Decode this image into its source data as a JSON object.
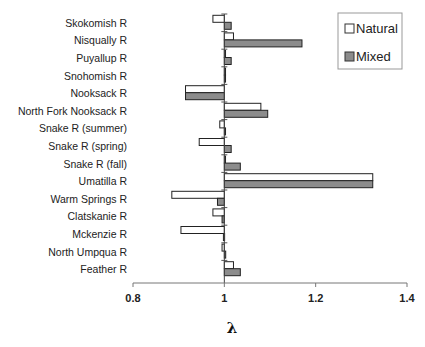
{
  "chart_data": {
    "type": "bar",
    "orientation": "horizontal",
    "title": "",
    "xlabel": "λ",
    "ylabel": "",
    "xlim": [
      0.8,
      1.4
    ],
    "baseline": 1.0,
    "x_ticks": [
      "0.8",
      "1",
      "1.2",
      "1.4"
    ],
    "x_tick_values": [
      0.8,
      1.0,
      1.2,
      1.4
    ],
    "grid": false,
    "legend_position": "top-right",
    "categories": [
      "Skokomish R",
      "Nisqually R",
      "Puyallup R",
      "Snohomish R",
      "Nooksack R",
      "North Fork Nooksack R",
      "Snake R (summer)",
      "Snake R (spring)",
      "Snake R (fall)",
      "Umatilla R",
      "Warm Springs R",
      "Clatskanie R",
      "Mckenzie R",
      "North Umpqua R",
      "Feather R"
    ],
    "series": [
      {
        "name": "Natural",
        "color": "#ffffff",
        "values": [
          0.975,
          1.02,
          1.002,
          1.0,
          0.915,
          1.08,
          0.99,
          0.945,
          1.0,
          1.325,
          0.885,
          0.975,
          0.905,
          0.995,
          1.02
        ]
      },
      {
        "name": "Mixed",
        "color": "#8c8c8c",
        "values": [
          1.015,
          1.17,
          1.015,
          1.0,
          0.915,
          1.095,
          1.0,
          1.015,
          1.035,
          1.325,
          0.985,
          0.995,
          0.998,
          1.003,
          1.035
        ]
      }
    ]
  },
  "legend": {
    "items": [
      {
        "label": "Natural",
        "color": "#ffffff"
      },
      {
        "label": "Mixed",
        "color": "#8c8c8c"
      }
    ]
  },
  "axis": {
    "xlabel": "λ",
    "ticks": [
      "0.8",
      "1",
      "1.2",
      "1.4"
    ]
  }
}
